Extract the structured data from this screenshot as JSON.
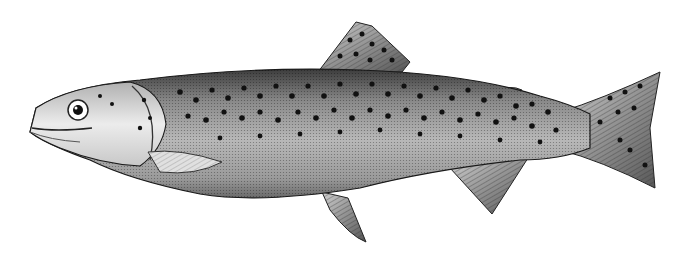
{
  "image": {
    "subject": "trout",
    "style": "black-and-white engraving",
    "background": "#ffffff",
    "colors": {
      "body_light": "#d9d9d9",
      "body_mid": "#a8a8a8",
      "body_dark": "#4a4a4a",
      "spots": "#111111",
      "outline": "#1a1a1a",
      "head": "#e6e6e6"
    }
  }
}
